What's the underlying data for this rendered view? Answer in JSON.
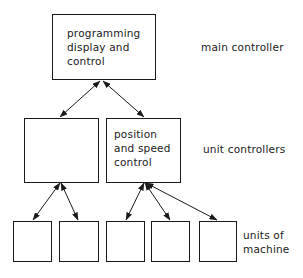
{
  "diagram": {
    "levels": [
      {
        "label": "main controller"
      },
      {
        "label": "unit controllers"
      },
      {
        "label": "units of\nmachine"
      }
    ],
    "boxes": {
      "main": {
        "text": "programming\ndisplay  and\ncontrol"
      },
      "unit_left": {
        "text": ""
      },
      "unit_right": {
        "text": "position\nand speed\ncontrol"
      },
      "machine_units": [
        "",
        "",
        "",
        "",
        ""
      ]
    },
    "connections": [
      {
        "from": "main",
        "to": "unit_left",
        "type": "bidirectional"
      },
      {
        "from": "main",
        "to": "unit_right",
        "type": "bidirectional"
      },
      {
        "from": "unit_left",
        "to": "machine_unit_1",
        "type": "bidirectional"
      },
      {
        "from": "unit_left",
        "to": "machine_unit_2",
        "type": "bidirectional"
      },
      {
        "from": "unit_right",
        "to": "machine_unit_3",
        "type": "bidirectional"
      },
      {
        "from": "unit_right",
        "to": "machine_unit_4",
        "type": "bidirectional"
      },
      {
        "from": "unit_right",
        "to": "machine_unit_5",
        "type": "bidirectional"
      }
    ]
  }
}
